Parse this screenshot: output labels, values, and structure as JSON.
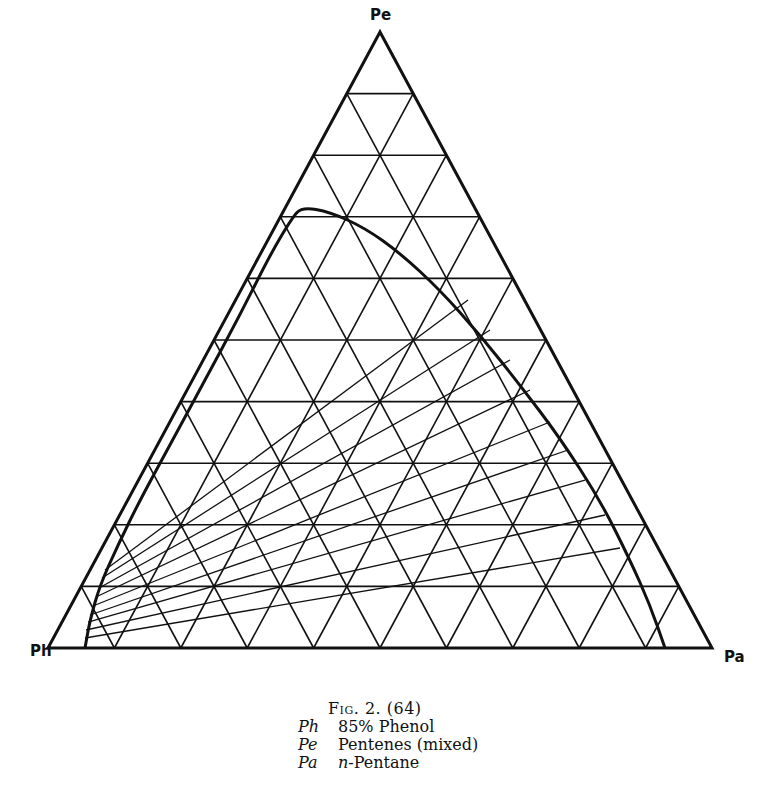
{
  "diagram": {
    "type": "ternary-phase-diagram",
    "divisions": 10,
    "vertices": {
      "top": {
        "label": "Pe",
        "x": 380,
        "y": 32
      },
      "left": {
        "label": "Ph",
        "x": 48,
        "y": 648
      },
      "right": {
        "label": "Pa",
        "x": 712,
        "y": 648
      }
    },
    "binodal_curve": [
      [
        85,
        648
      ],
      [
        90,
        620
      ],
      [
        100,
        585
      ],
      [
        118,
        545
      ],
      [
        140,
        500
      ],
      [
        170,
        445
      ],
      [
        205,
        380
      ],
      [
        240,
        315
      ],
      [
        270,
        255
      ],
      [
        292,
        218
      ],
      [
        302,
        207
      ],
      [
        330,
        212
      ],
      [
        365,
        228
      ],
      [
        400,
        253
      ],
      [
        440,
        290
      ],
      [
        480,
        335
      ],
      [
        520,
        385
      ],
      [
        560,
        438
      ],
      [
        600,
        500
      ],
      [
        630,
        560
      ],
      [
        650,
        605
      ],
      [
        665,
        648
      ]
    ],
    "tie_lines": [
      [
        [
          105,
          570
        ],
        [
          468,
          300
        ]
      ],
      [
        [
          102,
          578
        ],
        [
          490,
          330
        ]
      ],
      [
        [
          99,
          588
        ],
        [
          510,
          360
        ]
      ],
      [
        [
          96,
          597
        ],
        [
          530,
          390
        ]
      ],
      [
        [
          93,
          606
        ],
        [
          550,
          422
        ]
      ],
      [
        [
          90,
          615
        ],
        [
          568,
          450
        ]
      ],
      [
        [
          88,
          622
        ],
        [
          585,
          480
        ]
      ],
      [
        [
          86,
          630
        ],
        [
          605,
          515
        ]
      ],
      [
        [
          85,
          638
        ],
        [
          620,
          548
        ]
      ]
    ],
    "colors": {
      "line": "#111111",
      "background": "#ffffff"
    }
  },
  "labels": {
    "top": "Pe",
    "left": "Ph",
    "right": "Pa"
  },
  "caption": {
    "title": "Fig. 2. (64)",
    "legend": [
      {
        "symbol": "Ph",
        "description": "85% Phenol"
      },
      {
        "symbol": "Pe",
        "description": "Pentenes (mixed)"
      },
      {
        "symbol": "Pa",
        "description_prefix": "n",
        "description": "-Pentane"
      }
    ]
  }
}
